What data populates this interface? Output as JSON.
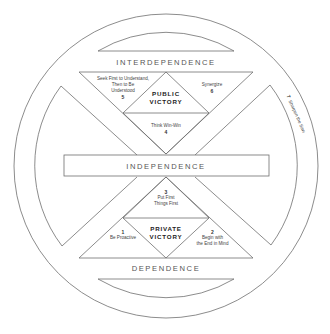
{
  "diagram": {
    "stages": {
      "top": "INTERDEPENDENCE",
      "middle": "INDEPENDENCE",
      "bottom": "DEPENDENCE"
    },
    "public_victory": {
      "label_line1": "PUBLIC",
      "label_line2": "VICTORY",
      "habits": [
        {
          "number": "5",
          "line1": "Seek First to Understand,",
          "line2": "Then to Be",
          "line3": "Understood"
        },
        {
          "number": "6",
          "line1": "Synergize"
        },
        {
          "number": "4",
          "line1": "Think Win-Win"
        }
      ]
    },
    "private_victory": {
      "label_line1": "PRIVATE",
      "label_line2": "VICTORY",
      "habits": [
        {
          "number": "3",
          "line1": "Put First",
          "line2": "Things First"
        },
        {
          "number": "1",
          "line1": "Be Proactive"
        },
        {
          "number": "2",
          "line1": "Begin with",
          "line2": "the End in Mind"
        }
      ]
    },
    "renewal": {
      "number": "7",
      "label": "Sharpen the Saw"
    },
    "colors": {
      "stroke": "#6e6e6e",
      "background": "#ffffff",
      "text": "#444444"
    }
  }
}
